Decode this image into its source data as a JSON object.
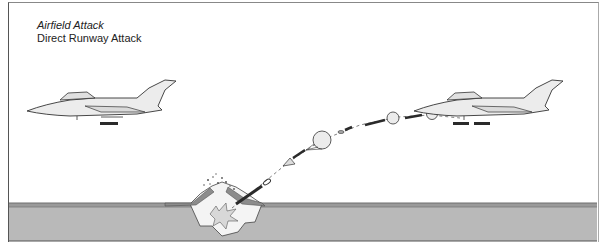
{
  "diagram": {
    "title": "Airfield Attack",
    "subtitle": "Direct Runway Attack",
    "elements": [
      "aircraft-left",
      "aircraft-right-dispensing",
      "parachute-retarded-munitions-trajectory",
      "runway-crater-explosion",
      "ground-runway-surface"
    ]
  },
  "colors": {
    "ground": "#b9b9b9",
    "ground_edge": "#6f6f6f",
    "aircraft_fill": "#ececec",
    "line": "#333333",
    "munition": "#2a2a2a"
  }
}
